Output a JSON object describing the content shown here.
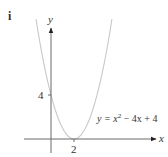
{
  "figure": {
    "part_label": "i",
    "x_axis_label": "x",
    "y_axis_label": "y",
    "y_intercept_tick_label": "4",
    "vertex_tick_label": "2",
    "equation_label": {
      "lhs": "y = x",
      "exponent": "2",
      "rhs": " − 4x + 4"
    }
  },
  "colors": {
    "axis": "#6b6b6b",
    "curve": "#c8c8c8",
    "text": "#333333"
  },
  "chart_data": {
    "type": "line",
    "title": "",
    "part_label": "i",
    "function": "y = x^2 - 4x + 4",
    "xlabel": "x",
    "ylabel": "y",
    "xlim": [
      -2.3,
      9
    ],
    "ylim": [
      -1.3,
      10
    ],
    "grid": false,
    "legend": null,
    "annotations": [
      {
        "text": "y = x^2 − 4x + 4",
        "near": [
          5.5,
          1.5
        ]
      },
      {
        "text": "4",
        "at": [
          0,
          4
        ],
        "type": "y-tick"
      },
      {
        "text": "2",
        "at": [
          2,
          0
        ],
        "type": "x-tick"
      }
    ],
    "key_points": [
      {
        "name": "y-intercept",
        "x": 0,
        "y": 4
      },
      {
        "name": "vertex (touches x-axis)",
        "x": 2,
        "y": 0
      }
    ],
    "x": [
      -1.3,
      -1,
      -0.5,
      0,
      0.5,
      1,
      1.5,
      2,
      2.5,
      3,
      3.5,
      4,
      4.5,
      5,
      5.3
    ],
    "series": [
      {
        "name": "y = x^2 - 4x + 4",
        "values": [
          10.89,
          9,
          6.25,
          4,
          2.25,
          1,
          0.25,
          0,
          0.25,
          1,
          2.25,
          4,
          6.25,
          9,
          10.89
        ]
      }
    ]
  }
}
